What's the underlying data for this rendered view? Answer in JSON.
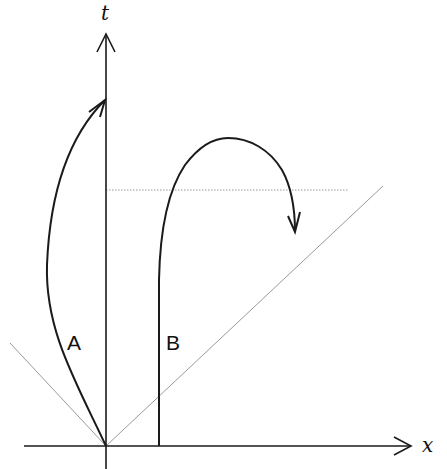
{
  "diagram": {
    "type": "spacetime-diagram",
    "axes": {
      "horizontal_label": "x",
      "vertical_label": "t"
    },
    "worldlines": [
      {
        "label": "A",
        "description": "curved path starting at origin, bending left then arching back to the t-axis with an arrow"
      },
      {
        "label": "B",
        "description": "vertical path that rises then arcs over and descends with an arrow"
      }
    ],
    "reference_lines": {
      "light_cone": "dotted diagonal lines through origin",
      "simultaneity_line": "dotted horizontal line"
    },
    "colors": {
      "ink": "#1a1a1a",
      "guide": "#9a9a9a"
    }
  }
}
